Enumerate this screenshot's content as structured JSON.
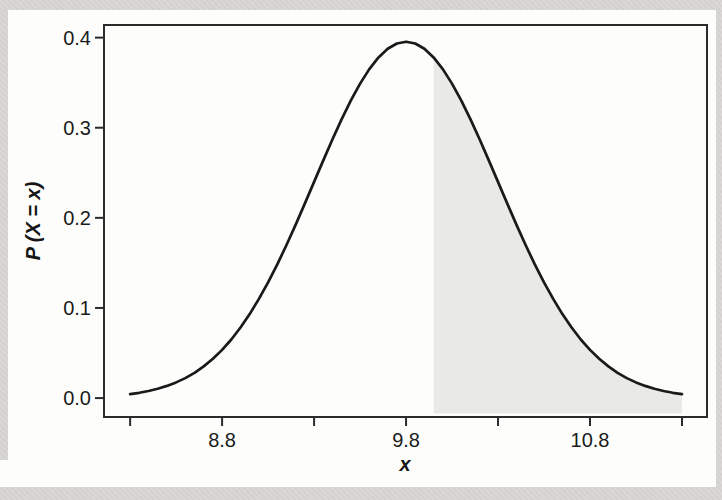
{
  "page": {
    "background_color": "#d8d7d3",
    "panel_color": "#fdfdfb",
    "description": "Normal curve with shaded upper tail region"
  },
  "chart_data": {
    "type": "area",
    "title": "",
    "xlabel": "x",
    "ylabel": "P (X = x)",
    "grid": false,
    "legend": "none",
    "curve_color": "#1a1a1a",
    "frame_color": "#2b2b2b",
    "tick_color": "#2b2b2b",
    "tick_label_color": "#1b1b1b",
    "x_ticks": [
      {
        "value": 8.3,
        "label": ""
      },
      {
        "value": 8.8,
        "label": "8.8"
      },
      {
        "value": 9.3,
        "label": ""
      },
      {
        "value": 9.8,
        "label": "9.8"
      },
      {
        "value": 10.3,
        "label": ""
      },
      {
        "value": 10.8,
        "label": "10.8"
      },
      {
        "value": 11.3,
        "label": ""
      }
    ],
    "y_ticks": [
      {
        "value": 0.0,
        "label": "0.0"
      },
      {
        "value": 0.1,
        "label": "0.1"
      },
      {
        "value": 0.2,
        "label": "0.2"
      },
      {
        "value": 0.3,
        "label": "0.3"
      },
      {
        "value": 0.4,
        "label": "0.4"
      }
    ],
    "curve": {
      "model": "bell curve, mean 9.8, peak 0.3955, effective sigma 0.5, drawn 8.3 to 11.3",
      "x_start": 8.3,
      "x_step": 0.05,
      "x_end": 11.3,
      "y": [
        0.0044,
        0.0059,
        0.0078,
        0.0103,
        0.0135,
        0.0174,
        0.0222,
        0.0281,
        0.0352,
        0.0436,
        0.0535,
        0.065,
        0.0783,
        0.0932,
        0.11,
        0.1284,
        0.1484,
        0.1699,
        0.1925,
        0.216,
        0.2399,
        0.2638,
        0.2872,
        0.3096,
        0.3303,
        0.349,
        0.3651,
        0.3781,
        0.3877,
        0.3935,
        0.3955,
        0.3935,
        0.3877,
        0.3781,
        0.3651,
        0.349,
        0.3303,
        0.3096,
        0.2872,
        0.2638,
        0.2399,
        0.216,
        0.1925,
        0.1699,
        0.1484,
        0.1284,
        0.11,
        0.0932,
        0.0783,
        0.065,
        0.0535,
        0.0436,
        0.0352,
        0.0281,
        0.0222,
        0.0174,
        0.0135,
        0.0103,
        0.0078,
        0.0059,
        0.0044
      ]
    },
    "shade": {
      "from_x": 9.95,
      "to_x": 11.3,
      "baseline_y": -0.017,
      "fill": "#e9e9e6"
    },
    "layout": {
      "box": {
        "left": 104,
        "top": 25,
        "right": 707,
        "bottom": 417
      },
      "xlim": [
        8.158,
        11.436
      ],
      "ylim": [
        -0.021,
        0.414
      ],
      "tick_len": 8,
      "tick_label_font_px": 20,
      "x_tick_label_baseline": 447,
      "y_tick_label_right": 91
    }
  }
}
